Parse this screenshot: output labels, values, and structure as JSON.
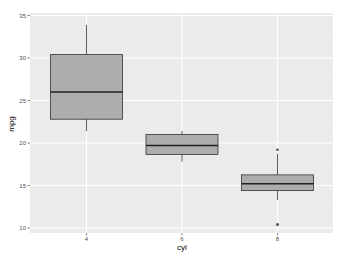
{
  "chart_data": {
    "type": "boxplot",
    "title": "",
    "xlabel": "cyl",
    "ylabel": "mpg",
    "categories": [
      "4",
      "6",
      "8"
    ],
    "ylim": [
      9.3,
      35.8
    ],
    "yticks": [
      "10",
      "15",
      "20",
      "25",
      "30",
      "35"
    ],
    "grid": true,
    "legend": null,
    "boxes": [
      {
        "category": "4",
        "min": 21.4,
        "q1": 22.8,
        "median": 26.0,
        "q3": 30.4,
        "max": 33.9,
        "outliers": []
      },
      {
        "category": "6",
        "min": 17.8,
        "q1": 18.65,
        "median": 19.7,
        "q3": 21.0,
        "max": 21.4,
        "outliers": []
      },
      {
        "category": "8",
        "min": 13.3,
        "q1": 14.4,
        "median": 15.2,
        "q3": 16.25,
        "max": 18.7,
        "outliers": [
          19.2,
          10.4,
          10.4
        ]
      }
    ],
    "colors": {
      "panel_background": "#EBEBEB",
      "grid_major": "#FFFFFF",
      "box_fill": "#ADADAD",
      "box_stroke": "#333333"
    }
  }
}
